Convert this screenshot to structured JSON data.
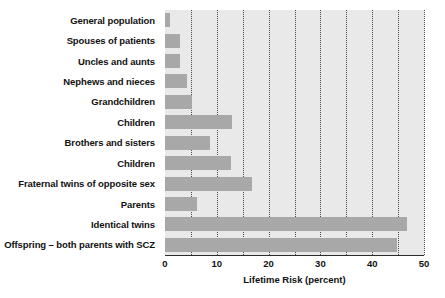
{
  "chart_data": {
    "type": "bar",
    "orientation": "horizontal",
    "title": "",
    "xlabel": "Lifetime Risk (percent)",
    "ylabel": "",
    "xlim": [
      0,
      50
    ],
    "xticks": [
      0,
      10,
      20,
      30,
      40,
      50
    ],
    "xticklabels": [
      "0",
      "10",
      "20",
      "30",
      "40",
      "50"
    ],
    "minor_gridlines": [
      5,
      10,
      15,
      20,
      25,
      30,
      35,
      40,
      45,
      50
    ],
    "grid": true,
    "legend": "none",
    "categories": [
      "General population",
      "Spouses of patients",
      "Uncles and aunts",
      "Nephews and nieces",
      "Grandchildren",
      "Children",
      "Brothers and sisters",
      "Children",
      "Fraternal twins of opposite sex",
      "Parents",
      "Identical twins",
      "Offspring – both parents with SCZ"
    ],
    "values": [
      1,
      2.9,
      2.9,
      4.2,
      5.2,
      13,
      8.7,
      12.8,
      16.7,
      6.2,
      46.7,
      44.8
    ],
    "bar_color": "#a8a8a8",
    "plot_background": "#e9e9e9",
    "gridline_color": "#4a4a4a",
    "text_color": "#111111"
  }
}
